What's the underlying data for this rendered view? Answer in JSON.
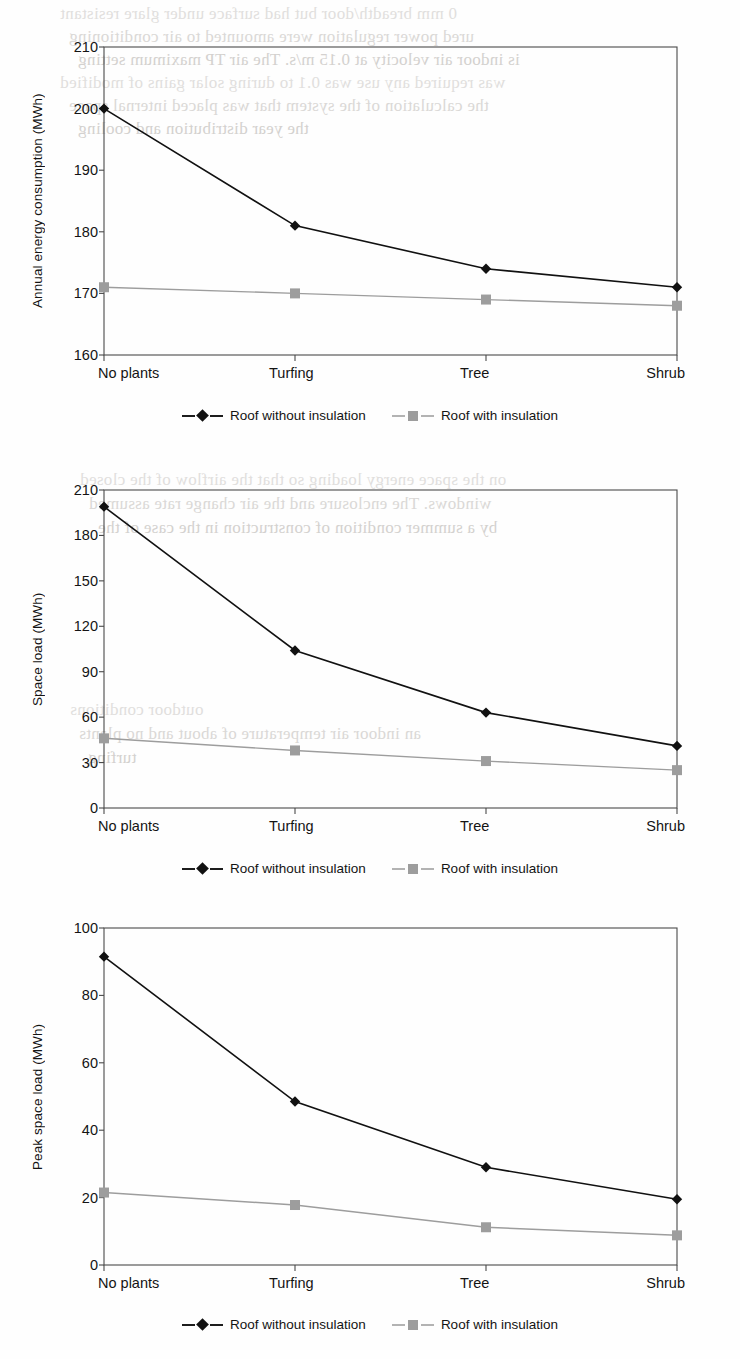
{
  "page": {
    "background_ghost_text": [
      "0 mm breadth/door but had surface under glare resistant",
      "ured power regulation were amounted to air conditioning",
      "is indoor air velocity at 0.15 m/s. The air TP maximum setting",
      "was required any use was 0.1 to during solar gains of modified",
      "the calculation of the system that was placed internal space",
      "the year distribution and cooling",
      "on the space energy loading so that the airflow of the closed",
      "windows. The enclosure and the air change rate assumed",
      "by a summer condition of construction in the case of the",
      "outdoor conditions",
      "an indoor air temperature of about and no plants",
      "turfing"
    ]
  },
  "common": {
    "categories": [
      "No plants",
      "Turfing",
      "Tree",
      "Shrub"
    ],
    "legend": [
      {
        "label": "Roof without insulation",
        "marker": "diamond",
        "color": "#111111"
      },
      {
        "label": "Roof with insulation",
        "marker": "square",
        "color": "#9d9d9d"
      }
    ]
  },
  "chart_data": [
    {
      "id": "annual-energy-consumption",
      "type": "line",
      "title": "",
      "xlabel": "",
      "ylabel": "Annual energy consumption (MWh)",
      "categories": [
        "No plants",
        "Turfing",
        "Tree",
        "Shrub"
      ],
      "ylim": [
        160,
        210
      ],
      "ytick_step": 10,
      "yticks": [
        160,
        170,
        180,
        190,
        200,
        210
      ],
      "grid": false,
      "legend_position": "bottom",
      "series": [
        {
          "name": "Roof without insulation",
          "marker": "diamond",
          "color": "#111111",
          "values": [
            200.0,
            181.0,
            174.0,
            171.0
          ]
        },
        {
          "name": "Roof with insulation",
          "marker": "square",
          "color": "#9d9d9d",
          "values": [
            171.0,
            170.0,
            169.0,
            168.0
          ]
        }
      ]
    },
    {
      "id": "space-load",
      "type": "line",
      "title": "",
      "xlabel": "",
      "ylabel": "Space load (MWh)",
      "categories": [
        "No plants",
        "Turfing",
        "Tree",
        "Shrub"
      ],
      "ylim": [
        0,
        210
      ],
      "ytick_step": 30,
      "yticks": [
        0,
        30,
        60,
        90,
        120,
        150,
        180,
        210
      ],
      "grid": false,
      "legend_position": "bottom",
      "series": [
        {
          "name": "Roof without insulation",
          "marker": "diamond",
          "color": "#111111",
          "values": [
            199.0,
            104.0,
            63.0,
            41.0
          ]
        },
        {
          "name": "Roof with insulation",
          "marker": "square",
          "color": "#9d9d9d",
          "values": [
            46.0,
            38.0,
            31.0,
            25.0
          ]
        }
      ]
    },
    {
      "id": "peak-space-load",
      "type": "line",
      "title": "",
      "xlabel": "",
      "ylabel": "Peak space load (MWh)",
      "categories": [
        "No plants",
        "Turfing",
        "Tree",
        "Shrub"
      ],
      "ylim": [
        0,
        100
      ],
      "ytick_step": 20,
      "yticks": [
        0,
        20,
        40,
        60,
        80,
        100
      ],
      "grid": false,
      "legend_position": "bottom",
      "series": [
        {
          "name": "Roof without insulation",
          "marker": "diamond",
          "color": "#111111",
          "values": [
            91.5,
            48.5,
            29.0,
            19.5
          ]
        },
        {
          "name": "Roof with insulation",
          "marker": "square",
          "color": "#9d9d9d",
          "values": [
            21.5,
            17.8,
            11.2,
            8.8
          ]
        }
      ]
    }
  ]
}
